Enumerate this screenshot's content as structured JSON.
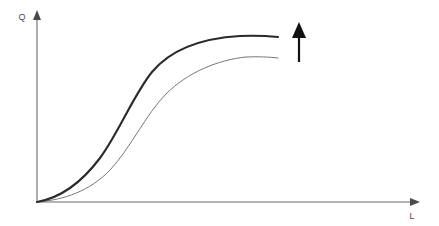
{
  "figure": {
    "name": "production-function-upward-shift",
    "background_color": "#ffffff",
    "width": 439,
    "height": 226
  },
  "axes": {
    "color": "#6a6a6a",
    "stroke_width": 1.1,
    "origin": {
      "x": 37,
      "y": 202
    },
    "y_axis": {
      "label": "Q",
      "label_x": 22,
      "label_y": 20,
      "top_y": 14,
      "arrow": "arrow-up"
    },
    "x_axis": {
      "label": "L",
      "label_x": 412,
      "label_y": 219,
      "right_x": 416,
      "arrow": "arrow-right"
    }
  },
  "annotation_arrow": {
    "name": "shift-up-arrow",
    "color": "#111111",
    "x": 299,
    "tail_y": 62,
    "head_y": 22,
    "shaft_width": 2.2,
    "head_half_width": 7,
    "head_height": 16,
    "meaning": "upward shift"
  },
  "chart_data": {
    "type": "line",
    "title": "",
    "subtitle": "",
    "xlabel": "L",
    "ylabel": "Q",
    "grid": false,
    "legend": "none",
    "annotations": [
      {
        "type": "arrow",
        "direction": "up",
        "x": 299,
        "y_from": 62,
        "y_to": 22,
        "label": ""
      }
    ],
    "xlim": [
      0,
      100
    ],
    "ylim": [
      0,
      100
    ],
    "series": [
      {
        "name": "new-production-function",
        "style": "thick-dark",
        "color": "#2a2a2a",
        "stroke_width": 2.1,
        "x": [
          0,
          5,
          10,
          15,
          20,
          25,
          30,
          35,
          40,
          45,
          50,
          55,
          60,
          65,
          70,
          75,
          80
        ],
        "values": [
          0,
          4,
          9,
          15,
          22,
          31,
          42,
          54,
          65,
          74,
          81,
          86,
          89,
          91,
          92,
          93,
          93
        ]
      },
      {
        "name": "original-production-function",
        "style": "thin-gray",
        "color": "#777777",
        "stroke_width": 1.0,
        "x": [
          0,
          5,
          10,
          15,
          20,
          25,
          30,
          35,
          40,
          45,
          50,
          55,
          60,
          65,
          70,
          75,
          80
        ],
        "values": [
          0,
          2,
          5,
          9,
          14,
          20,
          28,
          39,
          50,
          60,
          68,
          74,
          78,
          80,
          81,
          82,
          82
        ]
      }
    ]
  },
  "curves": {
    "upper": {
      "name": "upper-curve",
      "color": "#2a2a2a",
      "stroke_width": 2.1,
      "path": "M 37 202 C 60 198 82 182 100 158 C 118 134 134 94 152 72 C 172 48 206 38 240 36 C 254 35.5 268 36 278 37"
    },
    "lower": {
      "name": "lower-curve",
      "color": "#777777",
      "stroke_width": 1.0,
      "path": "M 37 202 C 64 200 90 191 110 170 C 130 149 146 114 166 94 C 188 72 218 60 246 57 C 258 56.5 270 57 278 58"
    }
  }
}
